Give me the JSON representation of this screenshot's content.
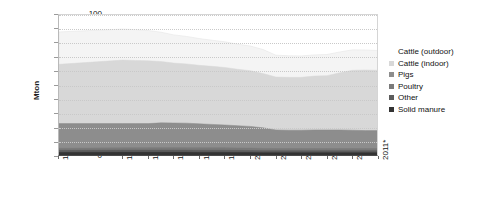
{
  "chart_data": {
    "type": "area",
    "stacked": true,
    "title": "",
    "xlabel": "",
    "ylabel": "Mton",
    "ylim": [
      0,
      100
    ],
    "ytick_labels": [
      "100",
      "90",
      "80",
      "70",
      "60",
      "50",
      "40",
      "30",
      "20",
      "10",
      "0"
    ],
    "ytick_values": [
      100,
      90,
      80,
      70,
      60,
      50,
      40,
      30,
      20,
      10,
      0
    ],
    "grid": true,
    "legend_position": "right",
    "x": [
      1986,
      1991,
      1992,
      1993,
      1994,
      1995,
      1996,
      1997,
      1998,
      1999,
      2000,
      2001,
      2002,
      2003,
      2004,
      2005,
      2006,
      2007,
      2008,
      2009,
      2010,
      2011
    ],
    "xtick_labels": [
      "1986",
      "1991",
      "1993",
      "1995",
      "1997",
      "1999",
      "2001",
      "2003",
      "2005",
      "2007",
      "2009",
      "2011*"
    ],
    "xtick_values": [
      1986,
      1991,
      1993,
      1995,
      1997,
      1999,
      2001,
      2003,
      2005,
      2007,
      2009,
      2011
    ],
    "series": [
      {
        "name": "Solid manure",
        "color": "#333333",
        "values": [
          2.5,
          2.6,
          2.6,
          2.6,
          2.6,
          2.6,
          2.6,
          2.5,
          2.5,
          2.5,
          2.4,
          2.4,
          2.3,
          2.3,
          2.3,
          2.3,
          2.3,
          2.3,
          2.3,
          2.3,
          2.3,
          2.3
        ]
      },
      {
        "name": "Other",
        "color": "#5c5c5c",
        "values": [
          1.5,
          1.6,
          1.6,
          1.6,
          1.6,
          1.6,
          1.6,
          1.6,
          1.6,
          1.6,
          1.6,
          1.5,
          1.5,
          1.5,
          1.5,
          1.5,
          1.5,
          1.5,
          1.5,
          1.5,
          1.5,
          1.5
        ]
      },
      {
        "name": "Poultry",
        "color": "#7a7a7a",
        "values": [
          1.5,
          1.6,
          1.6,
          1.7,
          1.7,
          1.7,
          1.7,
          1.7,
          1.7,
          1.7,
          1.7,
          1.7,
          1.6,
          1.5,
          1.5,
          1.5,
          1.5,
          1.5,
          1.5,
          1.5,
          1.5,
          1.5
        ]
      },
      {
        "name": "Pigs",
        "color": "#8d8d8d",
        "values": [
          17.5,
          17.2,
          17.2,
          17.1,
          17.6,
          17.5,
          17.4,
          17.0,
          16.6,
          16.2,
          15.8,
          15.4,
          14.6,
          13.2,
          13.0,
          13.0,
          13.2,
          13.2,
          13.2,
          13.0,
          12.7,
          12.7
        ]
      },
      {
        "name": "Cattle (indoor)",
        "color": "#d8d8d8",
        "values": [
          42.0,
          45.0,
          44.8,
          44.5,
          43.5,
          42.5,
          42.0,
          41.5,
          41.2,
          40.8,
          40.0,
          39.5,
          38.5,
          37.5,
          37.5,
          37.5,
          38.2,
          38.5,
          40.5,
          42.5,
          43.0,
          42.8
        ]
      },
      {
        "name": "Cattle (outdoor)",
        "color": "#f4f4f4",
        "values": [
          23.0,
          22.0,
          21.8,
          21.5,
          20.8,
          20.0,
          19.5,
          19.0,
          18.5,
          18.2,
          17.8,
          17.5,
          17.0,
          15.5,
          15.3,
          15.2,
          15.0,
          15.0,
          14.8,
          14.5,
          14.2,
          14.0
        ]
      }
    ],
    "legend": [
      {
        "label": "Cattle (outdoor)",
        "color": "#f4f4f4"
      },
      {
        "label": "Cattle (indoor)",
        "color": "#d8d8d8"
      },
      {
        "label": "Pigs",
        "color": "#8d8d8d"
      },
      {
        "label": "Poultry",
        "color": "#7a7a7a"
      },
      {
        "label": "Other",
        "color": "#5c5c5c"
      },
      {
        "label": "Solid manure",
        "color": "#333333"
      }
    ]
  }
}
